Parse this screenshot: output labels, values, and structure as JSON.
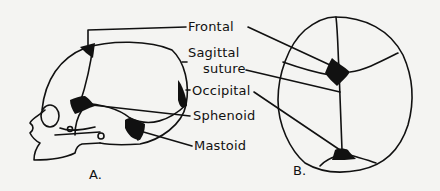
{
  "figure": {
    "panel_a": {
      "label": "A.",
      "view": "lateral-skull"
    },
    "panel_b": {
      "label": "B.",
      "view": "superior-skull"
    },
    "labels": [
      {
        "id": "frontal",
        "text": "Frontal"
      },
      {
        "id": "sagittal-1",
        "text": "Sagittal"
      },
      {
        "id": "sagittal-2",
        "text": "suture"
      },
      {
        "id": "occipital",
        "text": "Occipital"
      },
      {
        "id": "sphenoid",
        "text": "Sphenoid"
      },
      {
        "id": "mastoid",
        "text": "Mastoid"
      }
    ],
    "colors": {
      "ink": "#111111",
      "paper": "#f4f4f2"
    }
  }
}
